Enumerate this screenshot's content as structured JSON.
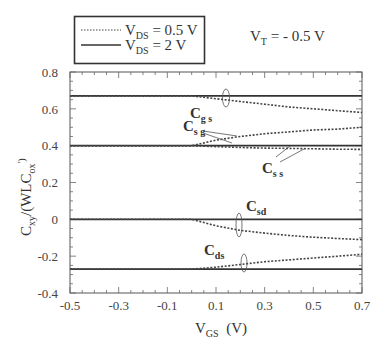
{
  "chart_data": {
    "type": "line",
    "title": "",
    "annotation": "V_T = - 0.5 V",
    "xlabel": "V_GS (V)",
    "ylabel": "C_xy/(WLC_ox')",
    "xlim": [
      -0.5,
      0.7
    ],
    "ylim": [
      -0.4,
      0.8
    ],
    "xticks": [
      -0.5,
      -0.3,
      -0.1,
      0.1,
      0.3,
      0.5,
      0.7
    ],
    "yticks": [
      -0.4,
      -0.2,
      0,
      0.2,
      0.4,
      0.6,
      0.8
    ],
    "grid": false,
    "legend_position": "top-left, outside plot",
    "legend": [
      {
        "name": "V_DS = 0.5 V",
        "style": "dotted"
      },
      {
        "name": "V_DS = 2 V",
        "style": "solid"
      }
    ],
    "series": [
      {
        "name": "Cgs (V_DS = 2 V)",
        "style": "solid",
        "x": [
          -0.5,
          0.7
        ],
        "y": [
          0.67,
          0.67
        ]
      },
      {
        "name": "Csg / Css (V_DS = 2 V)",
        "style": "solid",
        "x": [
          -0.5,
          0.7
        ],
        "y": [
          0.4,
          0.4
        ]
      },
      {
        "name": "Csd (V_DS = 2 V)",
        "style": "solid",
        "x": [
          -0.5,
          0.7
        ],
        "y": [
          0.0,
          0.0
        ]
      },
      {
        "name": "Cds (V_DS = 2 V)",
        "style": "solid",
        "x": [
          -0.5,
          0.7
        ],
        "y": [
          -0.27,
          -0.27
        ]
      },
      {
        "name": "Cgs (V_DS = 0.5 V)",
        "style": "dotted",
        "x": [
          -0.5,
          0.0,
          0.1,
          0.2,
          0.3,
          0.4,
          0.5,
          0.6,
          0.7
        ],
        "y": [
          0.67,
          0.67,
          0.655,
          0.64,
          0.625,
          0.61,
          0.6,
          0.59,
          0.58
        ]
      },
      {
        "name": "Csg (V_DS = 0.5 V)",
        "style": "dotted",
        "x": [
          -0.5,
          0.0,
          0.1,
          0.2,
          0.3,
          0.4,
          0.5,
          0.6,
          0.7
        ],
        "y": [
          0.4,
          0.4,
          0.43,
          0.45,
          0.465,
          0.475,
          0.485,
          0.49,
          0.5
        ]
      },
      {
        "name": "Css (V_DS = 0.5 V)",
        "style": "dotted",
        "x": [
          -0.5,
          0.0,
          0.1,
          0.2,
          0.3,
          0.4,
          0.5,
          0.6,
          0.7
        ],
        "y": [
          0.4,
          0.4,
          0.395,
          0.39,
          0.387,
          0.385,
          0.383,
          0.381,
          0.38
        ]
      },
      {
        "name": "Csd (V_DS = 0.5 V)",
        "style": "dotted",
        "x": [
          -0.5,
          0.0,
          0.1,
          0.2,
          0.3,
          0.4,
          0.5,
          0.6,
          0.7
        ],
        "y": [
          0.0,
          0.0,
          -0.035,
          -0.06,
          -0.075,
          -0.088,
          -0.097,
          -0.104,
          -0.11
        ]
      },
      {
        "name": "Cds (V_DS = 0.5 V)",
        "style": "dotted",
        "x": [
          -0.5,
          0.0,
          0.1,
          0.2,
          0.3,
          0.4,
          0.5,
          0.6,
          0.7
        ],
        "y": [
          -0.27,
          -0.27,
          -0.26,
          -0.245,
          -0.23,
          -0.22,
          -0.21,
          -0.2,
          -0.19
        ]
      }
    ],
    "curve_labels": [
      {
        "main": "C",
        "sub": "g s"
      },
      {
        "main": "C",
        "sub": "s g"
      },
      {
        "main": "C",
        "sub": "s s"
      },
      {
        "main": "C",
        "sub": "sd"
      },
      {
        "main": "C",
        "sub": "ds"
      }
    ]
  },
  "legend": {
    "row1_prefix": "V",
    "row1_sub": "DS",
    "row1_value": " = 0.5 V",
    "row2_prefix": "V",
    "row2_sub": "DS",
    "row2_value": " = 2 V"
  },
  "annotation": {
    "prefix": "V",
    "sub": "T",
    "value": " = - 0.5 V"
  },
  "axes": {
    "xlabel_main": "V",
    "xlabel_sub": "GS",
    "xlabel_unit": "  (V)",
    "ylabel_main": "C",
    "ylabel_sub": "xy",
    "ylabel_mid": "/(WLC",
    "ylabel_sub2": "ox",
    "ylabel_end": "')",
    "xtick_labels": [
      "-0.5",
      "-0.3",
      "-0.1",
      "0.1",
      "0.3",
      "0.5",
      "0.7"
    ],
    "ytick_labels": [
      "0.8",
      "0.6",
      "0.4",
      "0.2",
      "0",
      "-0.2",
      "-0.4"
    ]
  },
  "labels": {
    "cgs": {
      "main": "C",
      "sub": "g s"
    },
    "csg": {
      "main": "C",
      "sub": "s g"
    },
    "css": {
      "main": "C",
      "sub": "s s"
    },
    "csd": {
      "main": "C",
      "sub": "sd"
    },
    "cds": {
      "main": "C",
      "sub": "ds"
    }
  }
}
